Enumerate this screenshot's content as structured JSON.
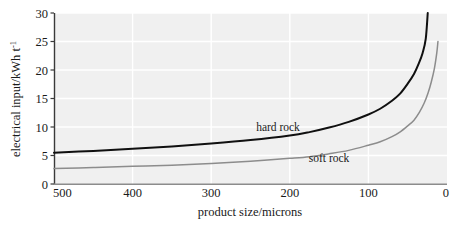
{
  "chart_data": {
    "type": "line",
    "title": "",
    "xlabel": "product size/microns",
    "ylabel": "electrical input/kWh t",
    "ylabel_superscript": "-1",
    "xlim": [
      500,
      0
    ],
    "ylim": [
      0,
      30
    ],
    "x_ticks": [
      "500",
      "400",
      "300",
      "200",
      "100",
      "0"
    ],
    "x_tick_values": [
      500,
      400,
      300,
      200,
      100,
      0
    ],
    "y_ticks": [
      "0",
      "5",
      "10",
      "15",
      "20",
      "25",
      "30"
    ],
    "y_tick_values": [
      0,
      5,
      10,
      15,
      20,
      25,
      30
    ],
    "x_axis_reversed": true,
    "grid": true,
    "grid_color": "#ffffff",
    "plot_background": "#f0f0f0",
    "legend_position": "inline-annotation",
    "series": [
      {
        "name": "hard rock",
        "color": "#101010",
        "label_x": 215,
        "label_y": 9.3,
        "x": [
          500,
          450,
          400,
          350,
          300,
          250,
          200,
          175,
          150,
          125,
          100,
          85,
          70,
          60,
          50,
          42,
          36,
          31,
          27,
          24.5
        ],
        "y": [
          5.5,
          5.8,
          6.2,
          6.6,
          7.1,
          7.7,
          8.5,
          9.1,
          9.9,
          10.9,
          12.2,
          13.2,
          14.6,
          15.8,
          17.6,
          19.3,
          21.1,
          23.0,
          25.5,
          30.0
        ]
      },
      {
        "name": "soft rock",
        "color": "#8c8c8c",
        "label_x": 150,
        "label_y": 3.9,
        "x": [
          500,
          450,
          400,
          350,
          300,
          250,
          200,
          175,
          150,
          125,
          100,
          85,
          70,
          60,
          50,
          42,
          35,
          29,
          24,
          20,
          16,
          13,
          11.5
        ],
        "y": [
          2.7,
          2.9,
          3.1,
          3.3,
          3.6,
          4.0,
          4.5,
          4.8,
          5.3,
          5.9,
          6.8,
          7.4,
          8.3,
          9.1,
          10.2,
          11.2,
          12.6,
          14.2,
          16.0,
          17.9,
          20.3,
          23.0,
          25.0
        ]
      }
    ]
  },
  "axes": {
    "y_axis_title_text": "electrical input/kWh t",
    "y_axis_title_exponent": "-1",
    "x_axis_title_text": "product size/microns"
  }
}
